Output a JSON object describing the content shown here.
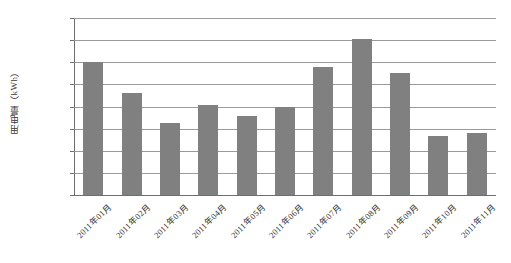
{
  "chart_data": {
    "type": "bar",
    "title": "",
    "xlabel": "",
    "ylabel": "用电量（kWh）",
    "ylim": [
      0,
      800000
    ],
    "ytick_step": 100000,
    "yticks": [
      800000,
      700000,
      600000,
      500000,
      400000,
      300000,
      200000,
      100000,
      0
    ],
    "ytick_labels": [
      "800000",
      "700000",
      "600000",
      "500000",
      "400000",
      "300000",
      "200000",
      "100000",
      "0"
    ],
    "grid": true,
    "legend": false,
    "legend_position": "none",
    "bar_color": "#808080",
    "categories": [
      "2011年01月",
      "2011年02月",
      "2011年03月",
      "2011年04月",
      "2011年05月",
      "2011年06月",
      "2011年07月",
      "2011年08月",
      "2011年09月",
      "2011年10月",
      "2011年11月"
    ],
    "values": [
      600000,
      460000,
      325000,
      408000,
      355000,
      400000,
      578000,
      705000,
      553000,
      265000,
      282000
    ]
  }
}
